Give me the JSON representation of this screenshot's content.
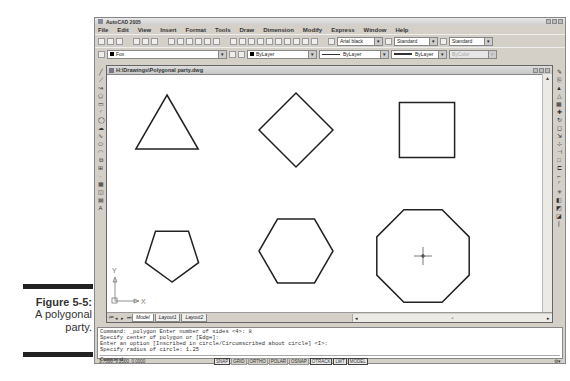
{
  "caption": {
    "figure_label": "Figure 5-5:",
    "line1": "A polygonal",
    "line2": "party."
  },
  "app": {
    "title": "AutoCAD 2005",
    "menu": [
      "File",
      "Edit",
      "View",
      "Insert",
      "Format",
      "Tools",
      "Draw",
      "Dimension",
      "Modify",
      "Express",
      "Window",
      "Help"
    ],
    "text_style": "Arial black",
    "dim_style": "Standard",
    "table_style": "Standard",
    "layer": "Fox",
    "color": "ByLayer",
    "linetype": "ByLayer",
    "lineweight": "ByLayer",
    "plotstyle": "ByColor"
  },
  "drawing": {
    "title": "H:\\Drawings\\Polygonal party.dwg",
    "shapes": [
      {
        "name": "triangle",
        "sides": 3
      },
      {
        "name": "diamond",
        "sides": 4
      },
      {
        "name": "square",
        "sides": 4
      },
      {
        "name": "pentagon",
        "sides": 5
      },
      {
        "name": "hexagon",
        "sides": 6
      },
      {
        "name": "octagon",
        "sides": 8
      }
    ],
    "ucs": {
      "x_label": "X",
      "y_label": "Y"
    },
    "tabs": [
      "Model",
      "Layout1",
      "Layout2"
    ],
    "active_tab": "Model"
  },
  "command": {
    "history": [
      "Command: _polygon Enter number of sides <4>: 8",
      "Specify center of polygon or [Edge]:",
      "Enter an option [Inscribed in circle/Circumscribed about circle] <I>:",
      "Specify radius of circle: 1.25"
    ],
    "prompt": "Command:"
  },
  "status": {
    "coords": "3.7500, 3.2500, 0.0000",
    "buttons": [
      {
        "label": "SNAP",
        "on": true
      },
      {
        "label": "GRID",
        "on": false
      },
      {
        "label": "ORTHO",
        "on": false
      },
      {
        "label": "POLAR",
        "on": false
      },
      {
        "label": "OSNAP",
        "on": false
      },
      {
        "label": "OTRACK",
        "on": true
      },
      {
        "label": "LWT",
        "on": true
      },
      {
        "label": "MODEL",
        "on": true
      }
    ]
  }
}
